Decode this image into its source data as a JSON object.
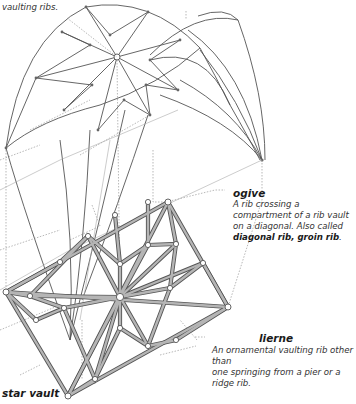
{
  "labels": {
    "top_left_fragment": "vaulting ribs.",
    "ogive": {
      "term": "ogive",
      "definition": "A rib crossing a compartment of a rib vault on a diagonal. Also called",
      "aliases": "diagonal rib, groin rib",
      "aliases_end": "."
    },
    "lierne": {
      "term": "lierne",
      "definition_line1": "An ornamental vaulting rib other than",
      "definition_line2": "one springing from a pier or a ridge rib."
    },
    "caption": "star vault"
  },
  "colors": {
    "line": "#555555",
    "rib_fill": "#a8a8a8",
    "dotted": "#777777",
    "text": "#222222"
  }
}
